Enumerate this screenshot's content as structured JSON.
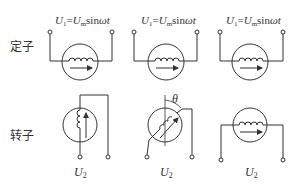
{
  "diagram": {
    "row_labels": {
      "stator": "定子",
      "rotor": "转子"
    },
    "stator_voltage": {
      "U": "U",
      "sub1": "1",
      "eq": "=",
      "Um": "U",
      "subm": "m",
      "sin": "sin",
      "wt": "ωt"
    },
    "rotor_voltage": {
      "U": "U",
      "sub": "2"
    },
    "angle_label": "θ",
    "columns": [
      {
        "rotor_orientation": "vertical"
      },
      {
        "rotor_orientation": "angled"
      },
      {
        "rotor_orientation": "horizontal"
      }
    ],
    "colors": {
      "line": "#333333",
      "background": "#ffffff"
    }
  }
}
